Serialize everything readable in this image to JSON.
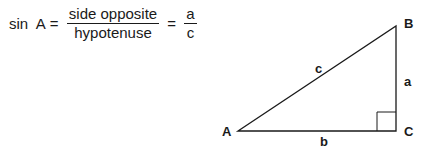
{
  "formula": {
    "lhs": "sin  A",
    "equals1": " = ",
    "fraction1": {
      "numerator": "side opposite",
      "denominator": "hypotenuse"
    },
    "equals2": " = ",
    "fraction2": {
      "numerator": "a",
      "denominator": "c"
    }
  },
  "triangle": {
    "vertices": {
      "A": {
        "label": "A",
        "x": 238,
        "y": 131
      },
      "B": {
        "label": "B",
        "x": 396,
        "y": 26
      },
      "C": {
        "label": "C",
        "x": 396,
        "y": 131
      }
    },
    "sides": {
      "a": {
        "label": "a",
        "description": "side opposite A (BC)"
      },
      "b": {
        "label": "b",
        "description": "adjacent side (AC)"
      },
      "c": {
        "label": "c",
        "description": "hypotenuse (AB)"
      }
    },
    "right_angle_at": "C",
    "stroke_color": "#1a1a1a"
  }
}
